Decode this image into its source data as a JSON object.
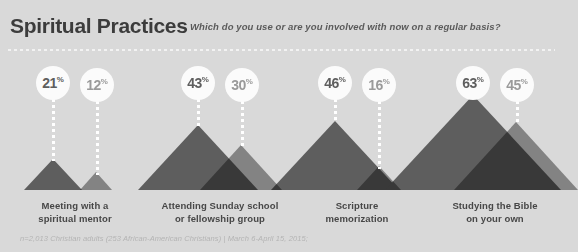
{
  "header": {
    "title": "Spiritual Practices",
    "subtitle": "Which do you use or are you involved with now on a regular basis?"
  },
  "footer": {
    "source": "n=2,013 Christian adults (253 African-American Christians) | March 6-April 15, 2015;"
  },
  "legend_colors": {
    "background": "#d9d9d9",
    "series_dark": "#5e5e5e",
    "series_light": "#9a9a9a",
    "bubble_fill": "#fbfbfb",
    "title_color": "#3c3c3c",
    "label_color": "#474747",
    "footer_color": "#b4b4b4"
  },
  "chart_data": {
    "type": "bar",
    "title": "Spiritual Practices",
    "subtitle": "Which do you use or are you involved with now on a regular basis?",
    "xlabel": "",
    "ylabel": "Percent",
    "ylim": [
      0,
      70
    ],
    "grid": false,
    "legend_position": "none",
    "unit": "%",
    "categories": [
      "Meeting with a spiritual mentor",
      "Attending Sunday school or fellowship group",
      "Scripture memorization",
      "Studying the Bible on your own"
    ],
    "series": [
      {
        "name": "All Christian adults",
        "color": "#5e5e5e",
        "values": [
          21,
          43,
          46,
          63
        ]
      },
      {
        "name": "African-American Christians",
        "color": "#9a9a9a",
        "values": [
          12,
          30,
          16,
          45
        ]
      }
    ]
  },
  "groups": [
    {
      "label_line1": "Meeting with a",
      "label_line2": "spiritual mentor",
      "bars": [
        {
          "value": "21",
          "pct": "%"
        },
        {
          "value": "12",
          "pct": "%"
        }
      ]
    },
    {
      "label_line1": "Attending Sunday school",
      "label_line2": "or fellowship group",
      "bars": [
        {
          "value": "43",
          "pct": "%"
        },
        {
          "value": "30",
          "pct": "%"
        }
      ]
    },
    {
      "label_line1": "Scripture",
      "label_line2": "memorization",
      "bars": [
        {
          "value": "46",
          "pct": "%"
        },
        {
          "value": "16",
          "pct": "%"
        }
      ]
    },
    {
      "label_line1": "Studying the Bible",
      "label_line2": "on your own",
      "bars": [
        {
          "value": "63",
          "pct": "%"
        },
        {
          "value": "45",
          "pct": "%"
        }
      ]
    }
  ]
}
